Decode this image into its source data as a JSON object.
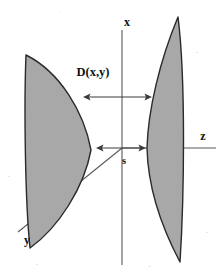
{
  "figure": {
    "name": "two-surface-gap-diagram",
    "background_color": "#ffffff",
    "width": 220,
    "height": 271
  },
  "labels": {
    "x_axis": "x",
    "y_axis": "y",
    "z_axis": "z",
    "distance": "D(x,y)",
    "gap": "s"
  },
  "colors": {
    "surface_fill": "#a8a8a8",
    "surface_stroke": "#2a2a2a",
    "axis_stroke": "#5a5a5a",
    "arrow_stroke": "#3c3c3c",
    "text": "#111111"
  },
  "geometry": {
    "origin": {
      "x": 122,
      "y": 148
    },
    "x_axis": {
      "x": 122,
      "y_top": 30,
      "y_bottom": 265
    },
    "z_axis": {
      "y": 148,
      "x_start": 122,
      "x_end": 216
    },
    "y_axis": {
      "x_start": 122,
      "y_start": 148,
      "x_end": 18,
      "y_end": 232
    },
    "distance_arrow": {
      "y": 97,
      "x_left": 83,
      "x_right": 152
    },
    "gap_arrow": {
      "y": 148,
      "x_left": 96,
      "x_right": 146
    },
    "left_surface": {
      "top_tip": {
        "x": 26,
        "y": 55
      },
      "bottom_tip": {
        "x": 30,
        "y": 248
      },
      "apex": {
        "x": 91,
        "y": 150
      }
    },
    "right_surface": {
      "top_tip": {
        "x": 178,
        "y": 17
      },
      "bottom_tip": {
        "x": 180,
        "y": 262
      },
      "apex": {
        "x": 147,
        "y": 148
      }
    }
  },
  "annotations": {
    "distance_label_pos": {
      "x": 93,
      "y": 73
    },
    "gap_label_pos": {
      "x": 124,
      "y": 162
    },
    "x_label_pos": {
      "x": 127,
      "y": 23
    },
    "y_label_pos": {
      "x": 27,
      "y": 241
    },
    "z_label_pos": {
      "x": 203,
      "y": 137
    }
  }
}
